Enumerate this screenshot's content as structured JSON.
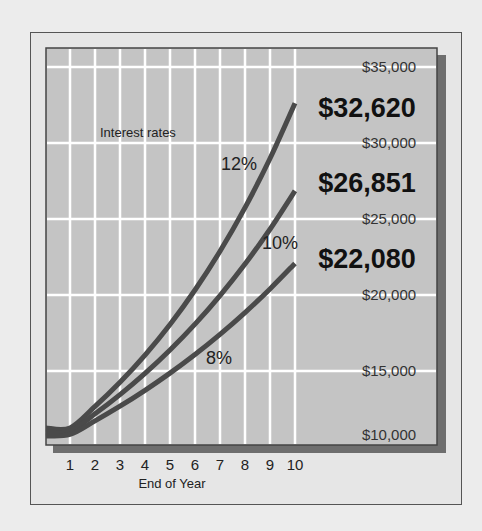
{
  "chart_data": {
    "type": "line",
    "title": "",
    "annotation": "Interest rates",
    "xlabel": "End of Year",
    "ylabel": "",
    "x": [
      0,
      1,
      2,
      3,
      4,
      5,
      6,
      7,
      8,
      9,
      10
    ],
    "x_tick_labels": [
      "1",
      "2",
      "3",
      "4",
      "5",
      "6",
      "7",
      "8",
      "9",
      "10"
    ],
    "y_tick_labels": [
      "$10,000",
      "$15,000",
      "$20,000",
      "$25,000",
      "$30,000",
      "$35,000"
    ],
    "y_ticks": [
      10000,
      15000,
      20000,
      25000,
      30000,
      35000
    ],
    "xlim": [
      0,
      10
    ],
    "ylim": [
      10000,
      35000
    ],
    "grid": true,
    "series": [
      {
        "name": "12%",
        "values": [
          10000,
          11255,
          12668,
          14258,
          16047,
          18061,
          20328,
          22879,
          25751,
          28983,
          32620
        ],
        "end_label": "$32,620"
      },
      {
        "name": "10%",
        "values": [
          10000,
          11038,
          12184,
          13449,
          14845,
          16386,
          18087,
          19965,
          22038,
          24325,
          26851
        ],
        "end_label": "$26,851"
      },
      {
        "name": "8%",
        "values": [
          10000,
          10824,
          11717,
          12682,
          13728,
          14859,
          16084,
          17410,
          18845,
          20399,
          22080
        ],
        "end_label": "$22,080"
      }
    ]
  },
  "colors": {
    "page_bg": "#ececec",
    "frame_bg": "#e6e6e6",
    "plot_bg": "#c4c4c4",
    "grid": "#ffffff",
    "line": "#4a4a4a",
    "shadow": "#6e6e6e",
    "text": "#222222"
  }
}
